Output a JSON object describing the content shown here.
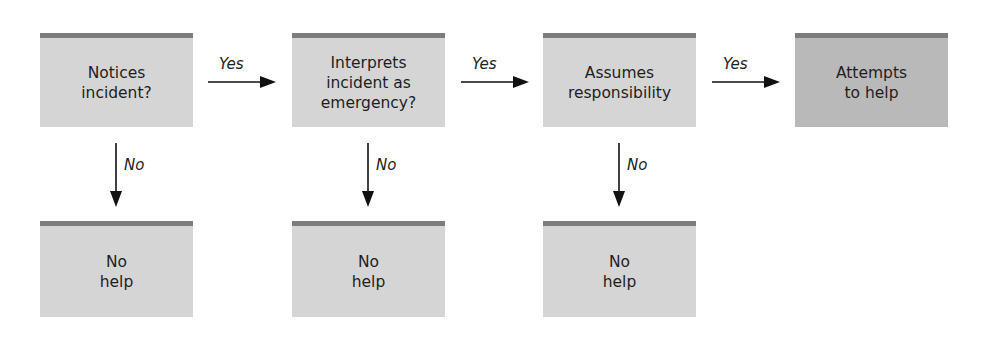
{
  "diagram": {
    "type": "flowchart",
    "colors": {
      "box_fill": "#d5d5d5",
      "final_box_fill": "#b9b9b9",
      "box_top_bar": "#7d7d7d",
      "arrow": "#111111"
    },
    "steps": [
      {
        "label": "Notices\nincident?"
      },
      {
        "label": "Interprets\nincident as\nemergency?"
      },
      {
        "label": "Assumes\nresponsibility"
      },
      {
        "label": "Attempts\nto help"
      }
    ],
    "outcomes": [
      {
        "label": "No\nhelp"
      },
      {
        "label": "No\nhelp"
      },
      {
        "label": "No\nhelp"
      }
    ],
    "edges": {
      "yes_label": "Yes",
      "no_label": "No"
    }
  }
}
